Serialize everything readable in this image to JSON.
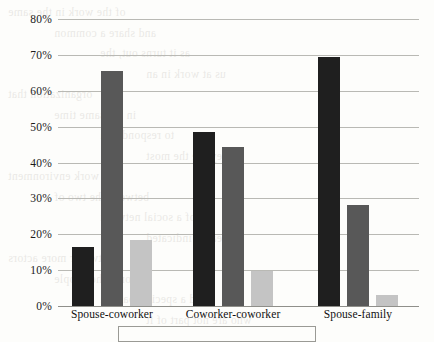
{
  "chart_data": {
    "type": "bar",
    "title": "",
    "xlabel": "",
    "ylabel": "",
    "ylim": [
      0,
      80
    ],
    "ytick_labels": [
      "0%",
      "10%",
      "20%",
      "30%",
      "40%",
      "50%",
      "60%",
      "70%",
      "80%"
    ],
    "ytick_values": [
      0,
      10,
      20,
      30,
      40,
      50,
      60,
      70,
      80
    ],
    "grid": true,
    "legend_position": "bottom",
    "categories": [
      "Spouse-coworker",
      "Coworker-coworker",
      "Spouse-family"
    ],
    "series": [
      {
        "name": "series-1",
        "color": "#1f1f1f",
        "values": [
          16.4,
          48.6,
          69.4
        ]
      },
      {
        "name": "series-2",
        "color": "#585858",
        "values": [
          65.6,
          44.4,
          28.3
        ]
      },
      {
        "name": "series-3",
        "color": "#c4c4c4",
        "values": [
          18.3,
          9.7,
          3.1
        ]
      }
    ]
  },
  "background_text": {
    "lines": [
      "of the work in the same",
      "and share a common",
      "as it turns out, the",
      "us at work in an",
      "organization that",
      "in the same time",
      "to respond to a",
      "they are the most",
      "in a work environment",
      "between the two of",
      "of a social network",
      "research indicated",
      "two or more actors",
      "not only the people",
      "and a specific pattern",
      "who are not part of it"
    ]
  }
}
